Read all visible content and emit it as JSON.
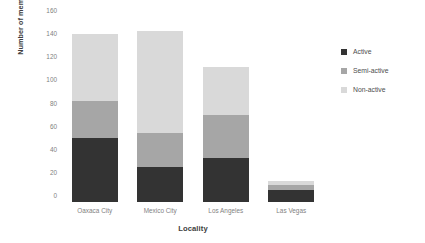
{
  "chart_data": {
    "type": "bar",
    "stacked": true,
    "title": "",
    "xlabel": "Locality",
    "ylabel": "Number of members",
    "categories": [
      "Oaxaca City",
      "Mexico City",
      "Los Angeles",
      "Las Vegas"
    ],
    "series": [
      {
        "name": "Active",
        "color": "#333333",
        "values": [
          55,
          30,
          38,
          10
        ]
      },
      {
        "name": "Semi-active",
        "color": "#a6a6a6",
        "values": [
          32,
          30,
          37,
          5
        ]
      },
      {
        "name": "Non-active",
        "color": "#d9d9d9",
        "values": [
          58,
          88,
          42,
          3
        ]
      }
    ],
    "totals": [
      145,
      148,
      117,
      18
    ],
    "ylim": [
      0,
      160
    ],
    "ytick_step": 20,
    "yticks": [
      160,
      140,
      120,
      100,
      80,
      60,
      40,
      20,
      0
    ],
    "ytick_labels": [
      "160",
      "140",
      "120",
      "100",
      "80",
      "60",
      "40",
      "20",
      "0"
    ],
    "grid": false,
    "legend_position": "right"
  },
  "legend": {
    "items": [
      {
        "label": "Active",
        "color": "#333333"
      },
      {
        "label": "Semi-active",
        "color": "#a6a6a6"
      },
      {
        "label": "Non-active",
        "color": "#d9d9d9"
      }
    ]
  }
}
